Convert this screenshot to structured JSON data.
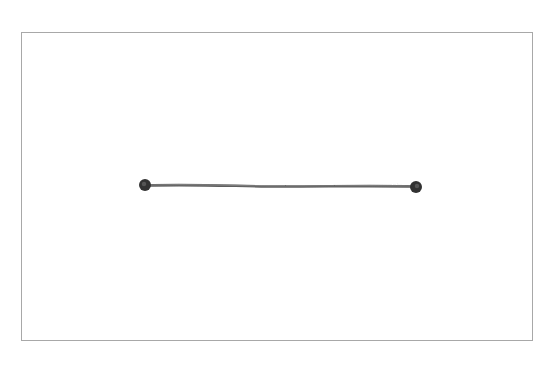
{
  "figure": {
    "frame": {
      "x": 21,
      "y": 32,
      "width": 512,
      "height": 309,
      "stroke": "#a8a8a8"
    },
    "segment": {
      "start": {
        "x": 145,
        "y": 185
      },
      "end": {
        "x": 416,
        "y": 187
      },
      "stroke": "#555555",
      "endpoint_color": "#333333",
      "endpoint_radius": 6
    }
  }
}
